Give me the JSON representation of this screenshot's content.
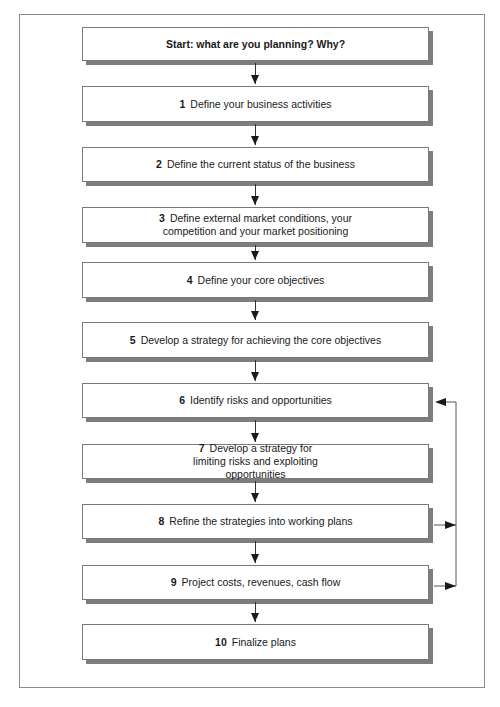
{
  "diagram": {
    "type": "flowchart",
    "start": {
      "label": "Start: what are you planning? Why?"
    },
    "steps": [
      {
        "num": "1",
        "label": "Define your business activities"
      },
      {
        "num": "2",
        "label": "Define the current status of the business"
      },
      {
        "num": "3",
        "label": "Define external market conditions, your competition and your market positioning"
      },
      {
        "num": "4",
        "label": "Define your core objectives"
      },
      {
        "num": "5",
        "label": "Develop a strategy for achieving the core objectives"
      },
      {
        "num": "6",
        "label": "Identify risks and opportunities"
      },
      {
        "num": "7",
        "label": "Develop a strategy for limiting risks and exploiting opportunities"
      },
      {
        "num": "8",
        "label": "Refine the strategies into working plans"
      },
      {
        "num": "9",
        "label": "Project costs, revenues, cash flow"
      },
      {
        "num": "10",
        "label": "Finalize plans"
      }
    ],
    "feedback_loop": {
      "from": [
        "8",
        "9"
      ],
      "to": "6"
    },
    "colors": {
      "box_border": "#7a7a7a",
      "shadow": "#7d7d7d",
      "arrow": "#1a1a1a",
      "frame": "#8a8a8a"
    }
  }
}
